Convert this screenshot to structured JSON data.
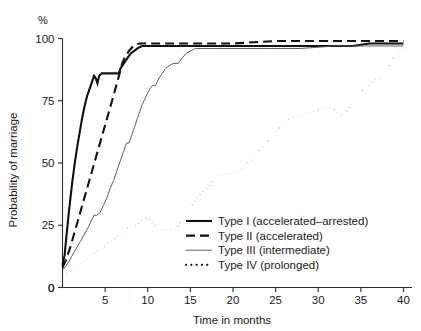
{
  "chart_data": {
    "type": "line",
    "title": "",
    "xlabel": "Time in months",
    "ylabel": "Probability of marriage",
    "yunit": "%",
    "xlim": [
      0,
      41
    ],
    "ylim": [
      0,
      100
    ],
    "grid": false,
    "legend_position": "bottom-right",
    "xticks": [
      0,
      5,
      10,
      15,
      20,
      25,
      30,
      35,
      40
    ],
    "xtick_labels": [
      "0",
      "5",
      "10",
      "15",
      "20",
      "25",
      "30",
      "35",
      "40"
    ],
    "yticks": [
      0,
      25,
      50,
      75,
      100
    ],
    "ytick_labels": [
      "0",
      "25",
      "50",
      "75",
      "100"
    ],
    "series": [
      {
        "name": "Type I (accelerated-arrested)",
        "style": "solid-bold",
        "color": "#111111",
        "width": 2.1,
        "points": [
          [
            0.0,
            9
          ],
          [
            0.25,
            13
          ],
          [
            0.5,
            22
          ],
          [
            0.8,
            32
          ],
          [
            1.1,
            41
          ],
          [
            1.4,
            49
          ],
          [
            1.7,
            56
          ],
          [
            2.0,
            62
          ],
          [
            2.3,
            68
          ],
          [
            2.6,
            73
          ],
          [
            2.9,
            77
          ],
          [
            3.2,
            80
          ],
          [
            3.5,
            83
          ],
          [
            3.7,
            85
          ],
          [
            3.9,
            84
          ],
          [
            4.1,
            82
          ],
          [
            4.3,
            85
          ],
          [
            4.6,
            86
          ],
          [
            5.0,
            86
          ],
          [
            5.5,
            86
          ],
          [
            6.0,
            86
          ],
          [
            6.4,
            86
          ],
          [
            6.6,
            86
          ],
          [
            6.8,
            88
          ],
          [
            7.2,
            90
          ],
          [
            7.6,
            92
          ],
          [
            8.0,
            94
          ],
          [
            8.4,
            95
          ],
          [
            8.8,
            96
          ],
          [
            9.3,
            97
          ],
          [
            10.0,
            97
          ],
          [
            12.0,
            97
          ],
          [
            15.0,
            97
          ],
          [
            20.0,
            97
          ],
          [
            25.0,
            97
          ],
          [
            30.0,
            97
          ],
          [
            34.0,
            97
          ],
          [
            36.0,
            98
          ],
          [
            38.0,
            98
          ],
          [
            40.0,
            98
          ]
        ]
      },
      {
        "name": "Type II (accelerated)",
        "style": "dashed-bold",
        "color": "#111111",
        "width": 2.1,
        "points": [
          [
            0.0,
            8
          ],
          [
            0.4,
            11
          ],
          [
            0.9,
            16
          ],
          [
            1.4,
            22
          ],
          [
            1.9,
            28
          ],
          [
            2.4,
            34
          ],
          [
            2.9,
            40
          ],
          [
            3.4,
            46
          ],
          [
            3.9,
            52
          ],
          [
            4.4,
            58
          ],
          [
            4.9,
            64
          ],
          [
            5.4,
            70
          ],
          [
            5.9,
            76
          ],
          [
            6.3,
            81
          ],
          [
            6.7,
            86
          ],
          [
            7.0,
            90
          ],
          [
            7.4,
            93
          ],
          [
            7.8,
            95
          ],
          [
            8.3,
            97
          ],
          [
            9.0,
            98
          ],
          [
            10.0,
            98
          ],
          [
            12.0,
            98
          ],
          [
            15.0,
            98
          ],
          [
            20.0,
            98
          ],
          [
            25.0,
            99
          ],
          [
            30.0,
            99
          ],
          [
            35.0,
            99
          ],
          [
            40.0,
            99
          ]
        ]
      },
      {
        "name": "Type III (intermediate)",
        "style": "solid-thin",
        "color": "#555555",
        "width": 0.95,
        "points": [
          [
            0.0,
            7
          ],
          [
            0.5,
            9
          ],
          [
            1.0,
            12
          ],
          [
            1.5,
            15
          ],
          [
            2.0,
            18
          ],
          [
            2.5,
            21
          ],
          [
            3.0,
            24
          ],
          [
            3.4,
            27
          ],
          [
            3.7,
            29
          ],
          [
            4.0,
            29
          ],
          [
            4.4,
            30
          ],
          [
            4.8,
            33
          ],
          [
            5.2,
            36
          ],
          [
            5.6,
            40
          ],
          [
            6.0,
            43
          ],
          [
            6.4,
            47
          ],
          [
            6.8,
            51
          ],
          [
            7.2,
            55
          ],
          [
            7.5,
            58
          ],
          [
            7.8,
            58
          ],
          [
            8.1,
            61
          ],
          [
            8.5,
            65
          ],
          [
            8.9,
            69
          ],
          [
            9.3,
            73
          ],
          [
            9.7,
            76
          ],
          [
            10.1,
            79
          ],
          [
            10.5,
            81
          ],
          [
            10.9,
            81
          ],
          [
            11.3,
            84
          ],
          [
            11.7,
            86
          ],
          [
            12.1,
            88
          ],
          [
            12.5,
            89
          ],
          [
            13.0,
            90
          ],
          [
            13.6,
            90
          ],
          [
            14.0,
            92
          ],
          [
            14.5,
            94
          ],
          [
            15.0,
            95
          ],
          [
            15.6,
            96
          ],
          [
            16.5,
            96
          ],
          [
            18.0,
            96
          ],
          [
            20.0,
            96
          ],
          [
            24.0,
            96
          ],
          [
            28.0,
            96
          ],
          [
            32.0,
            97
          ],
          [
            36.0,
            97
          ],
          [
            40.0,
            97
          ]
        ]
      },
      {
        "name": "Type IV (prolonged)",
        "style": "dotted",
        "color": "#1a1a1a",
        "width": 2.0,
        "points": [
          [
            0.0,
            5
          ],
          [
            0.6,
            6
          ],
          [
            1.2,
            7
          ],
          [
            1.8,
            9
          ],
          [
            2.4,
            10
          ],
          [
            3.0,
            12
          ],
          [
            3.6,
            13
          ],
          [
            4.2,
            15
          ],
          [
            4.8,
            16
          ],
          [
            5.4,
            18
          ],
          [
            6.0,
            19
          ],
          [
            6.6,
            21
          ],
          [
            7.2,
            22
          ],
          [
            7.6,
            24
          ],
          [
            8.2,
            25
          ],
          [
            8.8,
            25
          ],
          [
            9.4,
            27
          ],
          [
            10.0,
            28
          ],
          [
            10.5,
            26
          ],
          [
            11.0,
            24
          ],
          [
            11.6,
            23
          ],
          [
            12.2,
            23
          ],
          [
            12.8,
            23
          ],
          [
            13.4,
            24
          ],
          [
            14.0,
            27
          ],
          [
            14.6,
            30
          ],
          [
            15.2,
            33
          ],
          [
            15.8,
            36
          ],
          [
            16.4,
            38
          ],
          [
            17.0,
            40
          ],
          [
            17.6,
            43
          ],
          [
            18.2,
            45
          ],
          [
            18.8,
            45
          ],
          [
            19.6,
            46
          ],
          [
            20.4,
            46
          ],
          [
            21.2,
            48
          ],
          [
            22.0,
            51
          ],
          [
            22.8,
            54
          ],
          [
            23.6,
            57
          ],
          [
            24.4,
            60
          ],
          [
            25.2,
            63
          ],
          [
            26.0,
            66
          ],
          [
            26.8,
            68
          ],
          [
            27.6,
            69
          ],
          [
            28.6,
            70
          ],
          [
            29.6,
            71
          ],
          [
            30.6,
            72
          ],
          [
            31.6,
            72
          ],
          [
            32.4,
            70
          ],
          [
            33.0,
            69
          ],
          [
            33.8,
            73
          ],
          [
            34.6,
            77
          ],
          [
            35.4,
            80
          ],
          [
            36.2,
            82
          ],
          [
            36.8,
            84
          ],
          [
            37.4,
            84
          ],
          [
            38.2,
            88
          ],
          [
            38.8,
            92
          ],
          [
            39.4,
            95
          ],
          [
            40.0,
            96
          ]
        ]
      }
    ]
  },
  "legend": {
    "items": [
      {
        "label": "Type I (accelerated–arrested)",
        "style": "solid-bold"
      },
      {
        "label": "Type II (accelerated)",
        "style": "dashed-bold"
      },
      {
        "label": "Type III (intermediate)",
        "style": "solid-thin"
      },
      {
        "label": "Type IV (prolonged)",
        "style": "dotted"
      }
    ]
  }
}
